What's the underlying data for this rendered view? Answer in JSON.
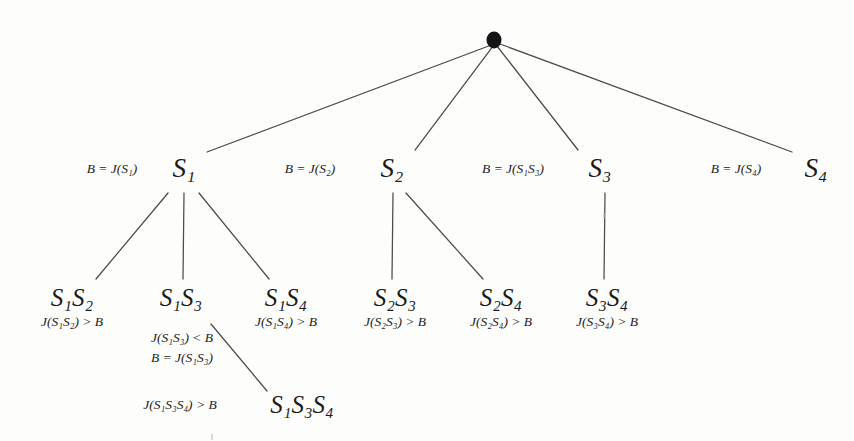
{
  "figure": {
    "type": "tree-diagram",
    "background_color": "#fdfdfc",
    "line_color": "#4a4a4a",
    "text_color": "#1a1a1a"
  },
  "root": {
    "name": "root-node",
    "shape": "filled-circle",
    "color": "#141414",
    "x": 494,
    "y": 40
  },
  "level1": [
    {
      "id": "s1",
      "label": "S",
      "sub": "1",
      "cond": "B = J(S1)",
      "cond_parts": [
        {
          "t": "B",
          "sub": ""
        },
        {
          "op": "="
        },
        {
          "t": "J(S",
          "sub": "1"
        },
        {
          "t": ")"
        }
      ],
      "x": 184,
      "y": 168,
      "cond_x": 112,
      "cond_y": 161
    },
    {
      "id": "s2",
      "label": "S",
      "sub": "2",
      "cond": "B = J(S2)",
      "x": 392,
      "y": 168,
      "cond_x": 310,
      "cond_y": 161
    },
    {
      "id": "s3",
      "label": "S",
      "sub": "3",
      "cond": "B = J(S1S3)",
      "x": 600,
      "y": 168,
      "cond_x": 512,
      "cond_y": 161
    },
    {
      "id": "s4",
      "label": "S",
      "sub": "4",
      "cond": "B = J(S4)",
      "x": 815,
      "y": 168,
      "cond_x": 735,
      "cond_y": 161
    }
  ],
  "level2": [
    {
      "id": "s1s2",
      "label": "S1S2",
      "x": 72,
      "y": 297,
      "conditions": [
        "J(S1S2) > B"
      ]
    },
    {
      "id": "s1s3",
      "label": "S1S3",
      "x": 180,
      "y": 297,
      "conditions": [
        "J(S1S3) < B",
        "B = J(S1S3)"
      ]
    },
    {
      "id": "s1s4",
      "label": "S1S4",
      "x": 285,
      "y": 297,
      "conditions": [
        "J(S1S4) > B"
      ]
    },
    {
      "id": "s2s3",
      "label": "S2S3",
      "x": 395,
      "y": 297,
      "conditions": [
        "J(S2S3) > B"
      ]
    },
    {
      "id": "s2s4",
      "label": "S2S4",
      "x": 500,
      "y": 297,
      "conditions": [
        "J(S2S4) > B"
      ]
    },
    {
      "id": "s3s4",
      "label": "S3S4",
      "x": 607,
      "y": 297,
      "conditions": [
        "J(S3S4) > B"
      ]
    }
  ],
  "level3": [
    {
      "id": "s1s3s4",
      "label": "S1S3S4",
      "x": 300,
      "y": 404,
      "conditions": [
        "J(S1S3S4) > B"
      ],
      "cond_x": 180,
      "cond_y": 396
    }
  ],
  "labels": {
    "s1": "S₁",
    "s2": "S₂",
    "s3": "S₃",
    "s4": "S₄",
    "s1s2": "S₁S₂",
    "s1s3": "S₁S₃",
    "s1s4": "S₁S₄",
    "s2s3": "S₂S₃",
    "s2s4": "S₂S₄",
    "s3s4": "S₃S₄",
    "s1s3s4": "S₁S₃S₄",
    "cond_s1": "B = J(S₁)",
    "cond_s2": "B = J(S₂)",
    "cond_s3": "B = J(S₁S₃)",
    "cond_s4": "B = J(S₄)",
    "cond_s1s2": "J(S₁S₂) > B",
    "cond_s1s3_a": "J(S₁S₃) < B",
    "cond_s1s3_b": "B = J(S₁S₃)",
    "cond_s1s4": "J(S₁S₄) > B",
    "cond_s2s3": "J(S₂S₃) > B",
    "cond_s2s4": "J(S₂S₄) > B",
    "cond_s3s4": "J(S₃S₄) > B",
    "cond_s1s3s4": "J(S₁S₃S₄) > B"
  },
  "edges": [
    {
      "name": "root-to-s1",
      "x1": 494,
      "y1": 44,
      "x2": 207,
      "y2": 152
    },
    {
      "name": "root-to-s2",
      "x1": 494,
      "y1": 46,
      "x2": 415,
      "y2": 150
    },
    {
      "name": "root-to-s3",
      "x1": 498,
      "y1": 46,
      "x2": 578,
      "y2": 150
    },
    {
      "name": "root-to-s4",
      "x1": 502,
      "y1": 44,
      "x2": 792,
      "y2": 152
    },
    {
      "name": "s1-to-s1s2",
      "x1": 168,
      "y1": 192,
      "x2": 96,
      "y2": 278
    },
    {
      "name": "s1-to-s1s3",
      "x1": 184,
      "y1": 192,
      "x2": 184,
      "y2": 278
    },
    {
      "name": "s1-to-s1s4",
      "x1": 198,
      "y1": 192,
      "x2": 268,
      "y2": 278
    },
    {
      "name": "s2-to-s2s3",
      "x1": 392,
      "y1": 192,
      "x2": 392,
      "y2": 278
    },
    {
      "name": "s2-to-s2s4",
      "x1": 404,
      "y1": 192,
      "x2": 482,
      "y2": 278
    },
    {
      "name": "s3-to-s3s4",
      "x1": 604,
      "y1": 192,
      "x2": 604,
      "y2": 278
    },
    {
      "name": "s1s3-to-s1s3s4",
      "x1": 212,
      "y1": 325,
      "x2": 266,
      "y2": 390
    }
  ]
}
